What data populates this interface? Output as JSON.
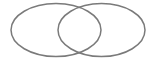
{
  "diagram": {
    "type": "venn",
    "background": "#ffffff",
    "stroke_color": "#7a7a7a",
    "stroke_width": 1.5,
    "sets": [
      {
        "name": "left-set",
        "cx": 56,
        "cy": 30,
        "rx": 45,
        "ry": 26.5
      },
      {
        "name": "right-set",
        "cx": 101.5,
        "cy": 30,
        "rx": 43.5,
        "ry": 26.5
      }
    ]
  }
}
